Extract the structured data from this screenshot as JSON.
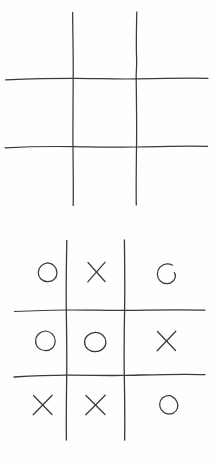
{
  "document": {
    "title": "Tic Tac Toe Sketch",
    "description": "Two hand-drawn tic-tac-toe grids on white paper",
    "background_color": "#fefefe",
    "ink_color": "#3a3a3a",
    "width": 214,
    "height": 463
  },
  "boards": [
    {
      "id": "board-top",
      "name": "empty-tic-tac-toe-grid",
      "label": "Empty board",
      "state": "empty",
      "grid": {
        "vertical_lines_x": [
          73,
          136
        ],
        "horizontal_lines_y": [
          78,
          147
        ],
        "vertical_extent_y": [
          12,
          205
        ],
        "horizontal_extent_x": [
          5,
          208
        ]
      },
      "cells": [
        {
          "row": 0,
          "col": 0,
          "mark": ""
        },
        {
          "row": 0,
          "col": 1,
          "mark": ""
        },
        {
          "row": 0,
          "col": 2,
          "mark": ""
        },
        {
          "row": 1,
          "col": 0,
          "mark": ""
        },
        {
          "row": 1,
          "col": 1,
          "mark": ""
        },
        {
          "row": 1,
          "col": 2,
          "mark": ""
        },
        {
          "row": 2,
          "col": 0,
          "mark": ""
        },
        {
          "row": 2,
          "col": 1,
          "mark": ""
        },
        {
          "row": 2,
          "col": 2,
          "mark": ""
        }
      ]
    },
    {
      "id": "board-bottom",
      "name": "filled-tic-tac-toe-grid",
      "label": "Completed board",
      "state": "filled",
      "grid": {
        "vertical_lines_x": [
          66,
          124
        ],
        "horizontal_lines_y": [
          310,
          375
        ],
        "vertical_extent_y": [
          240,
          440
        ],
        "horizontal_extent_x": [
          14,
          205
        ]
      },
      "cells": [
        {
          "row": 0,
          "col": 0,
          "mark": "O"
        },
        {
          "row": 0,
          "col": 1,
          "mark": "X"
        },
        {
          "row": 0,
          "col": 2,
          "mark": "O"
        },
        {
          "row": 1,
          "col": 0,
          "mark": "O"
        },
        {
          "row": 1,
          "col": 1,
          "mark": "O"
        },
        {
          "row": 1,
          "col": 2,
          "mark": "X"
        },
        {
          "row": 2,
          "col": 0,
          "mark": "X"
        },
        {
          "row": 2,
          "col": 1,
          "mark": "X"
        },
        {
          "row": 2,
          "col": 2,
          "mark": "O"
        }
      ]
    }
  ]
}
